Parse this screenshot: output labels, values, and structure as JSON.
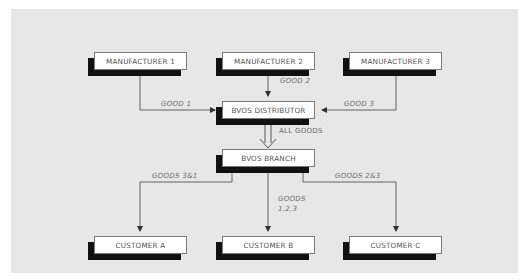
{
  "diagram": {
    "nodes": {
      "manufacturer1": "MANUFACTURER 1",
      "manufacturer2": "MANUFACTURER 2",
      "manufacturer3": "MANUFACTURER 3",
      "distributor": "BVOS DISTRIBUTOR",
      "branch": "BVOS BRANCH",
      "customerA": "CUSTOMER A",
      "customerB": "CUSTOMER B",
      "customerC": "CUSTOMER C"
    },
    "edges": {
      "m1_to_distributor": "GOOD 1",
      "m2_to_distributor": "GOOD 2",
      "m3_to_distributor": "GOOD 3",
      "distributor_to_branch": "ALL GOODS",
      "branch_to_customerA": "GOODS 3&1",
      "branch_to_customerB_line1": "GOODS",
      "branch_to_customerB_line2": "1,2,3",
      "branch_to_customerC": "GOODS 2&3"
    },
    "colors": {
      "panel": "#e7e7e7",
      "box": "#ffffff",
      "shadow": "#111111",
      "line": "#555555"
    }
  }
}
